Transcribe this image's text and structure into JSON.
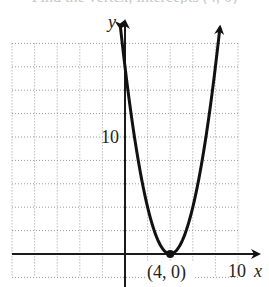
{
  "header": {
    "clipped_text": "Find the vertex, intercepts (4, 0)"
  },
  "chart_data": {
    "type": "line",
    "title": "",
    "function": "y = (x - 4)^2",
    "xlabel": "x",
    "ylabel": "y",
    "xlim": [
      -10,
      10
    ],
    "ylim": [
      -2,
      18
    ],
    "grid": true,
    "grid_spacing": 2,
    "tick_labels": {
      "x": [
        "10"
      ],
      "y": [
        "10"
      ]
    },
    "annotations": [
      {
        "text": "(4, 0)",
        "x": 4,
        "y": 0,
        "marker": "dot"
      }
    ],
    "series": [
      {
        "name": "parabola",
        "x": [
          -0.4,
          0,
          1,
          2,
          3,
          4,
          5,
          6,
          7,
          8,
          8.4
        ],
        "y": [
          19.36,
          16,
          9,
          4,
          1,
          0,
          1,
          4,
          9,
          16,
          19.36
        ]
      }
    ],
    "colors": {
      "curve": "#111111",
      "grid": "#9a9a9a",
      "axis": "#1a1a1a"
    }
  },
  "labels": {
    "x_axis": "x",
    "y_axis": "y",
    "x_tick_10": "10",
    "y_tick_10": "10",
    "vertex": "(4, 0)"
  }
}
